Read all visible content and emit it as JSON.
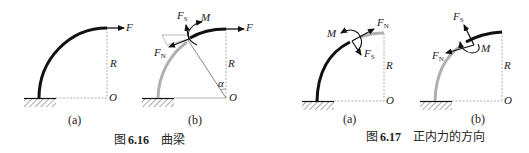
{
  "figure_6_16": {
    "caption_prefix": "图",
    "caption_number": "6.16",
    "caption_title": "曲梁",
    "panel_a": {
      "label": "(a)",
      "force": "F",
      "radius": "R",
      "origin": "O"
    },
    "panel_b": {
      "label": "(b)",
      "shear_force": "F",
      "shear_sub": "S",
      "normal_force": "F",
      "normal_sub": "N",
      "moment": "M",
      "force": "F",
      "radius": "R",
      "angle": "α",
      "origin": "O"
    }
  },
  "figure_6_17": {
    "caption_prefix": "图",
    "caption_number": "6.17",
    "caption_title": "正内力的方向",
    "panel_a": {
      "label": "(a)",
      "moment": "M",
      "normal_force": "F",
      "normal_sub": "N",
      "shear_force": "F",
      "shear_sub": "S",
      "radius": "R",
      "origin": "O"
    },
    "panel_b": {
      "label": "(b)",
      "shear_force": "F",
      "shear_sub": "S",
      "normal_force": "F",
      "normal_sub": "N",
      "moment": "M",
      "radius": "R",
      "origin": "O"
    }
  },
  "colors": {
    "beam": "#111111",
    "beam_cut": "#b0b0b0",
    "dashed": "#9a9a9a",
    "line": "#444444"
  }
}
